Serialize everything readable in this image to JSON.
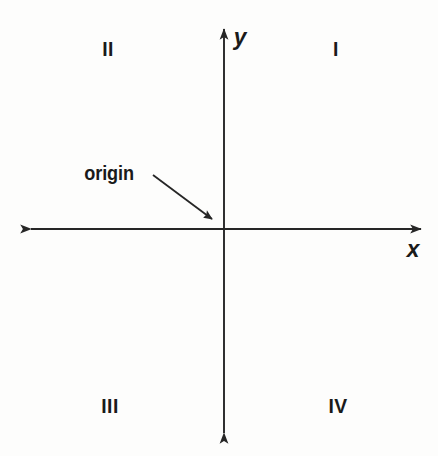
{
  "figure": {
    "background_color": "#fdfdfc",
    "stroke_color": "#262626",
    "text_color": "#1a1a1a"
  },
  "axes": {
    "x_axis": {
      "name": "x",
      "label": "x",
      "label_x": 413,
      "label_y": 249,
      "line_y": 229,
      "line_x_start": 31,
      "line_x_end": 421,
      "arrow_left": true,
      "arrow_right": true
    },
    "y_axis": {
      "name": "y",
      "label": "y",
      "label_x": 240,
      "label_y": 37,
      "line_x": 224,
      "line_y_start": 29,
      "line_y_end": 433,
      "arrow_up": true,
      "arrow_down": true
    },
    "origin_point": {
      "x": 224,
      "y": 229
    }
  },
  "quadrants": [
    {
      "id": "quadrant-1",
      "label": "I",
      "x": 336,
      "y": 48
    },
    {
      "id": "quadrant-2",
      "label": "II",
      "x": 108,
      "y": 48
    },
    {
      "id": "quadrant-3",
      "label": "III",
      "x": 110,
      "y": 405
    },
    {
      "id": "quadrant-4",
      "label": "IV",
      "x": 338,
      "y": 405
    }
  ],
  "callouts": [
    {
      "id": "origin-callout",
      "label": "origin",
      "text_x": 134,
      "text_y": 174,
      "arrow_from_x": 153,
      "arrow_from_y": 175,
      "arrow_to_x": 212,
      "arrow_to_y": 219
    }
  ]
}
